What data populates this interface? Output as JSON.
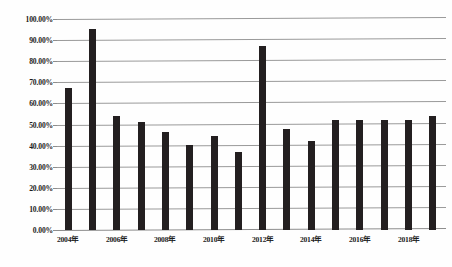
{
  "chart_data": {
    "type": "bar",
    "title": "",
    "xlabel": "",
    "ylabel": "",
    "ylim": [
      0,
      100
    ],
    "ytick_format": "percent",
    "grid": true,
    "legend": "none",
    "bar_color": "#231f20",
    "gridline_color": "#9a9a9a",
    "ytick_labels": [
      "100.00%",
      "90.00%",
      "80.00%",
      "70.00%",
      "60.00%",
      "50.00%",
      "40.00%",
      "30.00%",
      "20.00%",
      "10.00%",
      "0.00%"
    ],
    "ytick_values": [
      100,
      90,
      80,
      70,
      60,
      50,
      40,
      30,
      20,
      10,
      0
    ],
    "categories": [
      "2004年",
      "2005年",
      "2006年",
      "2007年",
      "2008年",
      "2009年",
      "2010年",
      "2011年",
      "2012年",
      "2013年",
      "2014年",
      "2015年",
      "2016年",
      "2017年",
      "2018年",
      "2019年"
    ],
    "xtick_labels_shown": [
      "2004年",
      "2006年",
      "2008年",
      "2010年",
      "2012年",
      "2014年",
      "2016年",
      "2018年"
    ],
    "values": [
      67.5,
      95.5,
      54.0,
      51.0,
      46.5,
      40.5,
      44.5,
      37.0,
      87.0,
      48.0,
      42.0,
      52.0,
      52.0,
      52.0,
      52.0,
      54.0
    ]
  }
}
